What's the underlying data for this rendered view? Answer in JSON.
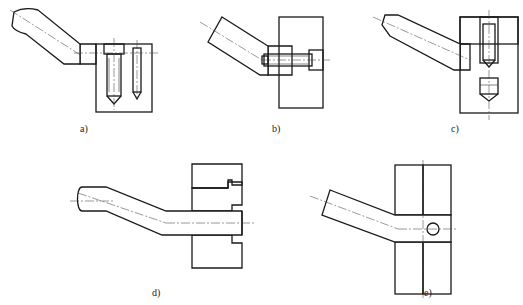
{
  "figure": {
    "type": "engineering-drawing",
    "line_color": "#1a1a1a",
    "background": "#ffffff"
  },
  "views": [
    {
      "id": "a",
      "label": "a)",
      "description": "Arm bolted onto block top with socket-head cap screw and dowel pin"
    },
    {
      "id": "b",
      "label": "b)",
      "description": "Inclined arm with hub fastened horizontally into wall by socket-head screw"
    },
    {
      "id": "c",
      "label": "c)",
      "description": "Chamfered arm inserted into block, secured with vertical threaded plug"
    },
    {
      "id": "d",
      "label": "d)",
      "description": "Cranked arm with stepped shank fitted through stepped bore in wall"
    },
    {
      "id": "e",
      "label": "e)",
      "description": "Bent arm through split block, retained by cross pin"
    }
  ]
}
